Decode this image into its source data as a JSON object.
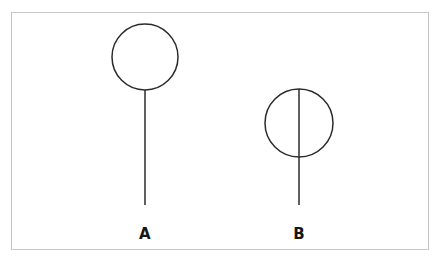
{
  "figure": {
    "title": "",
    "background_color": "#ffffff",
    "border": {
      "name": "figure-border",
      "color": "#c8c8c8",
      "stroke_width": 1,
      "x": 11.5,
      "y": 12.5,
      "width": 417,
      "height": 237
    },
    "stroke_color": "#2b2b2b",
    "stroke_width": 1.5,
    "label_color": "#161616"
  },
  "chart_data": {
    "type": "diagram",
    "title": "",
    "items": [
      {
        "id": "A",
        "label": "A",
        "circle": {
          "cx": 145,
          "cy": 57,
          "r": 33,
          "fill": "none"
        },
        "line": {
          "x1": 145,
          "y1": 90,
          "x2": 145,
          "y2": 205,
          "passes_through_circle": false
        },
        "label_pos": {
          "x": 145,
          "y": 239
        }
      },
      {
        "id": "B",
        "label": "B",
        "circle": {
          "cx": 299,
          "cy": 123,
          "r": 34,
          "fill": "none"
        },
        "line": {
          "x1": 299,
          "y1": 89,
          "x2": 299,
          "y2": 205,
          "passes_through_circle": true
        },
        "label_pos": {
          "x": 299,
          "y": 239
        }
      }
    ]
  }
}
